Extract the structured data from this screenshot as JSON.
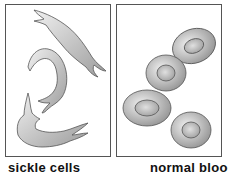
{
  "panels": [
    {
      "id": "left",
      "subject": "sickle cells",
      "caption": "sickle cells"
    },
    {
      "id": "right",
      "subject": "normal blood cells",
      "caption": "normal blood cells"
    }
  ],
  "colors": {
    "cell_fill_light": "#e8e8e8",
    "cell_fill_dark": "#9a9a9a",
    "outline": "#555555",
    "border": "#555555"
  }
}
